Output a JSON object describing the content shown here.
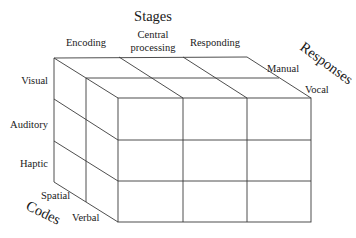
{
  "diagram": {
    "type": "3d-cube-taxonomy",
    "axes": {
      "stages": {
        "title": "Stages",
        "values": [
          "Encoding",
          "Central processing",
          "Responding"
        ],
        "central_line1": "Central",
        "central_line2": "processing"
      },
      "modalities": {
        "values": [
          "Visual",
          "Auditory",
          "Haptic"
        ]
      },
      "codes": {
        "title": "Codes",
        "values": [
          "Spatial",
          "Verbal"
        ]
      },
      "responses": {
        "title": "Responses",
        "values": [
          "Manual",
          "Vocal"
        ]
      }
    },
    "colors": {
      "line": "#3a3a3a",
      "text": "#1a1a1a",
      "background": "#ffffff"
    }
  }
}
